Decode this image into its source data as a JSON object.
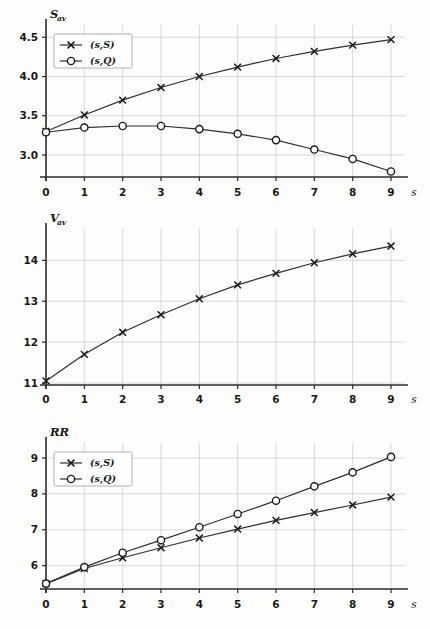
{
  "figure": {
    "background_color": "#fdfdfc",
    "line_color": "#2e2e2e",
    "grid_color": "#c9c9c9",
    "axis_color": "#2b2b2b"
  },
  "chart_data": [
    {
      "id": "chart-s-av",
      "type": "line",
      "title": "",
      "ylabel": "S",
      "ylabel_sub": "av",
      "xlabel": "s",
      "x": [
        0,
        1,
        2,
        3,
        4,
        5,
        6,
        7,
        8,
        9
      ],
      "xtick_labels": [
        "0",
        "1",
        "2",
        "3",
        "4",
        "5",
        "6",
        "7",
        "8",
        "9"
      ],
      "ytick_labels": [
        "3.0",
        "3.5",
        "4.0",
        "4.5"
      ],
      "yticks": [
        3.0,
        3.5,
        4.0,
        4.5
      ],
      "xlim": [
        0,
        9
      ],
      "ylim": [
        2.72,
        4.58
      ],
      "grid": true,
      "legend_position": "upper left",
      "series": [
        {
          "name": "(s,S)",
          "marker": "x",
          "values": [
            3.3,
            3.51,
            3.7,
            3.86,
            4.0,
            4.12,
            4.23,
            4.32,
            4.4,
            4.47
          ]
        },
        {
          "name": "(s,Q)",
          "marker": "o",
          "values": [
            3.29,
            3.35,
            3.37,
            3.37,
            3.33,
            3.27,
            3.19,
            3.07,
            2.95,
            2.79
          ]
        }
      ]
    },
    {
      "id": "chart-v-av",
      "type": "line",
      "title": "",
      "ylabel": "V",
      "ylabel_sub": "av",
      "xlabel": "s",
      "x": [
        0,
        1,
        2,
        3,
        4,
        5,
        6,
        7,
        8,
        9
      ],
      "xtick_labels": [
        "0",
        "1",
        "2",
        "3",
        "4",
        "5",
        "6",
        "7",
        "8",
        "9"
      ],
      "ytick_labels": [
        "11",
        "12",
        "13",
        "14"
      ],
      "yticks": [
        11,
        12,
        13,
        14
      ],
      "xlim": [
        0,
        9
      ],
      "ylim": [
        10.95,
        14.62
      ],
      "grid": true,
      "legend_position": "none",
      "series": [
        {
          "name": "(s,S)",
          "marker": "x",
          "values": [
            11.05,
            11.7,
            12.24,
            12.67,
            13.06,
            13.4,
            13.68,
            13.94,
            14.16,
            14.35
          ]
        }
      ]
    },
    {
      "id": "chart-rr",
      "type": "line",
      "title": "",
      "ylabel": "RR",
      "ylabel_sub": "",
      "xlabel": "s",
      "x": [
        0,
        1,
        2,
        3,
        4,
        5,
        6,
        7,
        8,
        9
      ],
      "xtick_labels": [
        "0",
        "1",
        "2",
        "3",
        "4",
        "5",
        "6",
        "7",
        "8",
        "9"
      ],
      "ytick_labels": [
        "6",
        "7",
        "8",
        "9"
      ],
      "yticks": [
        6,
        7,
        8,
        9
      ],
      "xlim": [
        0,
        9
      ],
      "ylim": [
        5.35,
        9.25
      ],
      "grid": true,
      "legend_position": "upper left",
      "series": [
        {
          "name": "(s,S)",
          "marker": "x",
          "values": [
            5.5,
            5.92,
            6.22,
            6.5,
            6.77,
            7.02,
            7.26,
            7.48,
            7.69,
            7.91
          ]
        },
        {
          "name": "(s,Q)",
          "marker": "o",
          "values": [
            5.5,
            5.96,
            6.36,
            6.71,
            7.07,
            7.44,
            7.81,
            8.21,
            8.6,
            9.03
          ]
        }
      ]
    }
  ]
}
